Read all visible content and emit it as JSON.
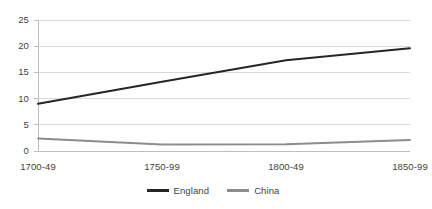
{
  "chart_data": {
    "type": "line",
    "title": "",
    "xlabel": "",
    "ylabel": "",
    "categories": [
      "1700-49",
      "1750-99",
      "1800-49",
      "1850-99"
    ],
    "series": [
      {
        "name": "England",
        "values": [
          9.0,
          13.2,
          17.3,
          19.6
        ],
        "color": "#262626"
      },
      {
        "name": "China",
        "values": [
          2.4,
          1.25,
          1.3,
          2.1
        ],
        "color": "#8c8c8c"
      }
    ],
    "ylim": [
      0,
      25
    ],
    "yticks": [
      0,
      5,
      10,
      15,
      20,
      25
    ],
    "ytick_labels": [
      "0",
      "5",
      "10",
      "15",
      "20",
      "25"
    ],
    "grid": true,
    "grid_color": "#d9d9d9",
    "legend_position": "bottom",
    "axis_line_color": "#bfbfbf"
  },
  "legend": {
    "entries": [
      {
        "label": "England"
      },
      {
        "label": "China"
      }
    ]
  }
}
